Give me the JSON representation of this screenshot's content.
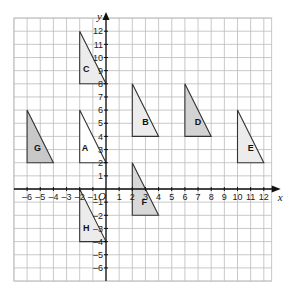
{
  "diagram": {
    "type": "coordinate-grid",
    "x_axis_label": "x",
    "y_axis_label": "y",
    "origin_label": "O",
    "x_ticks": [
      -6,
      -5,
      -4,
      -3,
      -2,
      -1,
      1,
      2,
      3,
      4,
      5,
      6,
      7,
      8,
      9,
      10,
      11,
      12
    ],
    "y_ticks": [
      -6,
      -5,
      -4,
      -3,
      -2,
      -1,
      1,
      2,
      3,
      4,
      5,
      6,
      7,
      8,
      9,
      10,
      11,
      12
    ],
    "grid": {
      "xmin": -7,
      "xmax": 12.6,
      "ymin": -7,
      "ymax": 13
    },
    "colors": {
      "grid": "#bbbbbb",
      "axis": "#111111",
      "shaded": "#cfcfcf",
      "light": "#ececec",
      "outline": "#333333"
    },
    "triangles": [
      {
        "label": "A",
        "points": [
          [
            -2,
            6
          ],
          [
            -2,
            2
          ],
          [
            0,
            2
          ]
        ],
        "fill": "#ffffff",
        "label_pos": [
          -1.6,
          2.9
        ]
      },
      {
        "label": "B",
        "points": [
          [
            2,
            8
          ],
          [
            2,
            4
          ],
          [
            4,
            4
          ]
        ],
        "fill": "#ececec",
        "label_pos": [
          3,
          4.9
        ]
      },
      {
        "label": "C",
        "points": [
          [
            -2,
            12
          ],
          [
            -2,
            8
          ],
          [
            0,
            8
          ]
        ],
        "fill": "#ececec",
        "label_pos": [
          -1.5,
          8.9
        ]
      },
      {
        "label": "D",
        "points": [
          [
            6,
            8
          ],
          [
            6,
            4
          ],
          [
            8,
            4
          ]
        ],
        "fill": "#d3d3d3",
        "label_pos": [
          7,
          4.9
        ]
      },
      {
        "label": "E",
        "points": [
          [
            10,
            6
          ],
          [
            10,
            2
          ],
          [
            12,
            2
          ]
        ],
        "fill": "#ececec",
        "label_pos": [
          11,
          2.9
        ]
      },
      {
        "label": "F",
        "points": [
          [
            2,
            2
          ],
          [
            2,
            -2
          ],
          [
            4,
            -2
          ]
        ],
        "fill": "#d8d8d8",
        "label_pos": [
          2.9,
          -1.2
        ]
      },
      {
        "label": "G",
        "points": [
          [
            -6,
            6
          ],
          [
            -6,
            2
          ],
          [
            -4,
            2
          ]
        ],
        "fill": "#c8c8c8",
        "label_pos": [
          -5.2,
          2.9
        ]
      },
      {
        "label": "H",
        "points": [
          [
            -2,
            0
          ],
          [
            -2,
            -4
          ],
          [
            0,
            -4
          ]
        ],
        "fill": "#ececec",
        "label_pos": [
          -1.5,
          -3.2
        ]
      }
    ]
  }
}
